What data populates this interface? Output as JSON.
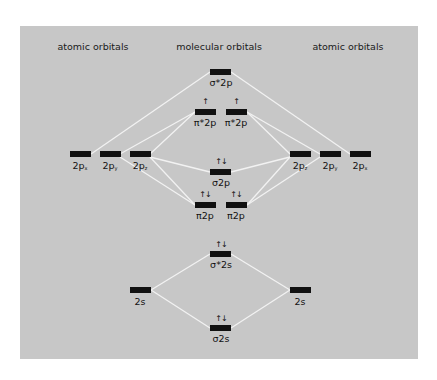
{
  "headers": {
    "left": "atomic orbitals",
    "center": "molecular orbitals",
    "right": "atomic orbitals"
  },
  "colors": {
    "panel": "#c7c7c7",
    "bar": "#111111",
    "line": "#f2f2f2"
  },
  "atomic_left": [
    {
      "label": "2p",
      "sub": "x",
      "electrons": ""
    },
    {
      "label": "2p",
      "sub": "y",
      "electrons": ""
    },
    {
      "label": "2p",
      "sub": "z",
      "electrons": ""
    },
    {
      "label": "2s",
      "sub": "",
      "electrons": ""
    }
  ],
  "atomic_right": [
    {
      "label": "2p",
      "sub": "z",
      "electrons": ""
    },
    {
      "label": "2p",
      "sub": "y",
      "electrons": ""
    },
    {
      "label": "2p",
      "sub": "x",
      "electrons": ""
    },
    {
      "label": "2s",
      "sub": "",
      "electrons": ""
    }
  ],
  "molecular": [
    {
      "label": "σ*2p",
      "electrons": ""
    },
    {
      "label": "π*2p",
      "electrons": "↑"
    },
    {
      "label": "π*2p",
      "electrons": "↑"
    },
    {
      "label": "σ2p",
      "electrons": "↑↓"
    },
    {
      "label": "π2p",
      "electrons": "↑↓"
    },
    {
      "label": "π2p",
      "electrons": "↑↓"
    },
    {
      "label": "σ*2s",
      "electrons": "↑↓"
    },
    {
      "label": "σ2s",
      "electrons": "↑↓"
    }
  ]
}
